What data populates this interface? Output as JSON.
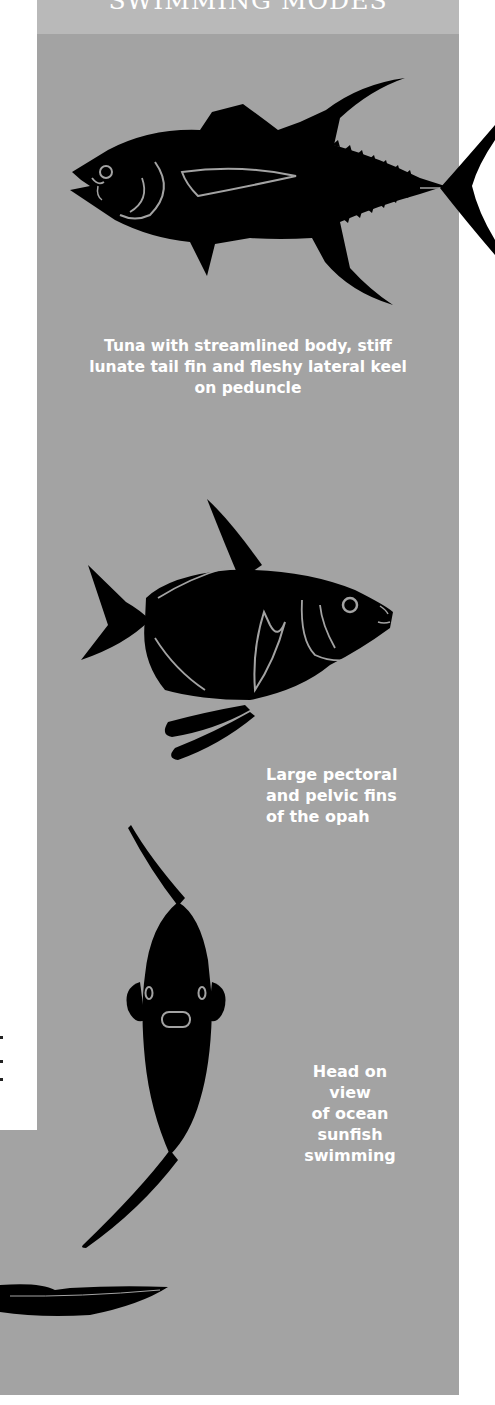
{
  "header": {
    "title": "SWIMMING MODES"
  },
  "figures": [
    {
      "id": "tuna",
      "icon": "tuna-silhouette-icon",
      "caption_lines": [
        "Tuna with streamlined body, stiff",
        "lunate tail fin and fleshy lateral keel",
        "on peduncle"
      ]
    },
    {
      "id": "opah",
      "icon": "opah-silhouette-icon",
      "caption_lines": [
        "Large pectoral",
        "and pelvic fins",
        "of the opah"
      ]
    },
    {
      "id": "sunfish",
      "icon": "sunfish-head-on-icon",
      "caption_lines": [
        "Head on view",
        "of ocean",
        "sunfish",
        "swimming"
      ]
    }
  ],
  "colors": {
    "panel": "#a3a3a3",
    "header_band": "#b9b9b9",
    "silhouette": "#000000",
    "caption_text": "#ffffff",
    "page": "#ffffff"
  }
}
